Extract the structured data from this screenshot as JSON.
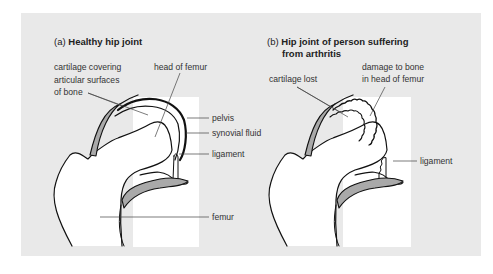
{
  "panel_a": {
    "prefix": "(a)",
    "title": "Healthy hip joint",
    "labels": {
      "cartilage_1": "cartilage covering",
      "cartilage_2": "articular surfaces",
      "cartilage_3": "of bone",
      "head_of_femur": "head of femur",
      "pelvis": "pelvis",
      "synovial_fluid": "synovial fluid",
      "ligament": "ligament",
      "femur": "femur"
    }
  },
  "panel_b": {
    "prefix": "(b)",
    "title_1": "Hip joint of person suffering",
    "title_2": "from arthritis",
    "labels": {
      "cartilage_lost": "cartilage lost",
      "damage_1": "damage to bone",
      "damage_2": "in head of femur",
      "ligament": "ligament"
    }
  },
  "colors": {
    "panel_bg": "#e9e9e9",
    "inset_bg": "#ffffff",
    "cartilage": "#a9a9a9",
    "outline": "#111111"
  }
}
